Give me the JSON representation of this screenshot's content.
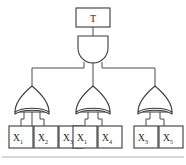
{
  "figure": {
    "kind": "fault-tree-diagram",
    "background_color": "#ffffff",
    "line_color": "#3a3a3a",
    "text_color": "#1d1d1d",
    "footer_rule_color": "#c9c9c9"
  },
  "top_event": {
    "label": "T",
    "shape": "rectangle"
  },
  "top_gate": {
    "type": "AND",
    "name": "and-gate",
    "input_count": 3
  },
  "or_gates": [
    {
      "type": "OR",
      "name": "or-gate-left",
      "input_count": 3
    },
    {
      "type": "OR",
      "name": "or-gate-middle",
      "input_count": 2
    },
    {
      "type": "OR",
      "name": "or-gate-right",
      "input_count": 2
    }
  ],
  "basic_events": {
    "left_group": [
      {
        "base": "X",
        "sub": "1"
      },
      {
        "base": "X",
        "sub": "2"
      },
      {
        "base": "X",
        "sub": "3"
      }
    ],
    "middle_group": [
      {
        "base": "X",
        "sub": "1"
      },
      {
        "base": "X",
        "sub": "4"
      }
    ],
    "right_group": [
      {
        "base": "X",
        "sub": "3"
      },
      {
        "base": "X",
        "sub": "5"
      }
    ]
  }
}
